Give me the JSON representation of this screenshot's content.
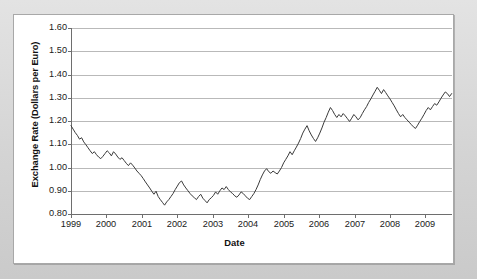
{
  "figure": {
    "background_color": "#d6d6d6",
    "card_color": "#ffffff",
    "line_color": "#3a3a3a",
    "grid_color": "#b9b9b9",
    "axis_color": "#6e6e6e"
  },
  "chart_data": {
    "type": "line",
    "title": "",
    "xlabel": "Date",
    "ylabel": "Exchange Rate (Dollars per Euro)",
    "ylim": [
      0.8,
      1.6
    ],
    "xlim": [
      1999.0,
      2009.75
    ],
    "grid": true,
    "legend": "none",
    "ytick_labels": [
      "0.80",
      "0.90",
      "1.00",
      "1.10",
      "1.20",
      "1.30",
      "1.40",
      "1.50",
      "1.60"
    ],
    "ytick_values": [
      0.8,
      0.9,
      1.0,
      1.1,
      1.2,
      1.3,
      1.4,
      1.5,
      1.6
    ],
    "xtick_labels": [
      "1999",
      "2000",
      "2001",
      "2002",
      "2003",
      "2004",
      "2005",
      "2006",
      "2007",
      "2008",
      "2009"
    ],
    "xtick_values": [
      1999,
      2000,
      2001,
      2002,
      2003,
      2004,
      2005,
      2006,
      2007,
      2008,
      2009
    ],
    "series": [
      {
        "name": "USD per EUR",
        "x": [
          1999.0,
          1999.06,
          1999.12,
          1999.18,
          1999.24,
          1999.3,
          1999.36,
          1999.42,
          1999.48,
          1999.54,
          1999.6,
          1999.66,
          1999.72,
          1999.78,
          1999.84,
          1999.9,
          1999.96,
          2000.02,
          2000.08,
          2000.14,
          2000.2,
          2000.26,
          2000.32,
          2000.38,
          2000.44,
          2000.5,
          2000.56,
          2000.62,
          2000.68,
          2000.74,
          2000.8,
          2000.86,
          2000.92,
          2000.98,
          2001.04,
          2001.1,
          2001.16,
          2001.22,
          2001.28,
          2001.34,
          2001.4,
          2001.46,
          2001.52,
          2001.58,
          2001.64,
          2001.7,
          2001.76,
          2001.82,
          2001.88,
          2001.94,
          2002.0,
          2002.06,
          2002.12,
          2002.18,
          2002.24,
          2002.3,
          2002.36,
          2002.42,
          2002.48,
          2002.54,
          2002.6,
          2002.66,
          2002.72,
          2002.78,
          2002.84,
          2002.9,
          2002.96,
          2003.02,
          2003.08,
          2003.14,
          2003.2,
          2003.26,
          2003.32,
          2003.38,
          2003.44,
          2003.5,
          2003.56,
          2003.62,
          2003.68,
          2003.74,
          2003.8,
          2003.86,
          2003.92,
          2003.98,
          2004.04,
          2004.1,
          2004.16,
          2004.22,
          2004.28,
          2004.34,
          2004.4,
          2004.46,
          2004.52,
          2004.58,
          2004.64,
          2004.7,
          2004.76,
          2004.82,
          2004.88,
          2004.94,
          2005.0,
          2005.06,
          2005.12,
          2005.18,
          2005.24,
          2005.3,
          2005.36,
          2005.42,
          2005.48,
          2005.54,
          2005.6,
          2005.66,
          2005.72,
          2005.78,
          2005.84,
          2005.9,
          2005.96,
          2006.02,
          2006.08,
          2006.14,
          2006.2,
          2006.26,
          2006.32,
          2006.38,
          2006.44,
          2006.5,
          2006.56,
          2006.62,
          2006.68,
          2006.74,
          2006.8,
          2006.86,
          2006.92,
          2006.98,
          2007.04,
          2007.1,
          2007.16,
          2007.22,
          2007.28,
          2007.34,
          2007.4,
          2007.46,
          2007.52,
          2007.58,
          2007.64,
          2007.7,
          2007.76,
          2007.82,
          2007.88,
          2007.94,
          2008.0,
          2008.06,
          2008.12,
          2008.18,
          2008.24,
          2008.3,
          2008.36,
          2008.42,
          2008.48,
          2008.54,
          2008.6,
          2008.66,
          2008.72,
          2008.78,
          2008.84,
          2008.9,
          2008.96,
          2009.02,
          2009.08,
          2009.14,
          2009.2,
          2009.26,
          2009.32,
          2009.38,
          2009.44,
          2009.5,
          2009.56,
          2009.62,
          2009.68,
          2009.74
        ],
        "y": [
          1.18,
          1.165,
          1.15,
          1.138,
          1.122,
          1.128,
          1.11,
          1.098,
          1.085,
          1.072,
          1.06,
          1.068,
          1.055,
          1.045,
          1.038,
          1.048,
          1.06,
          1.072,
          1.063,
          1.05,
          1.068,
          1.058,
          1.045,
          1.035,
          1.042,
          1.03,
          1.018,
          1.008,
          1.02,
          1.01,
          0.998,
          0.985,
          0.975,
          0.965,
          0.952,
          0.938,
          0.925,
          0.912,
          0.898,
          0.885,
          0.898,
          0.875,
          0.862,
          0.85,
          0.838,
          0.852,
          0.862,
          0.875,
          0.888,
          0.905,
          0.92,
          0.935,
          0.942,
          0.925,
          0.912,
          0.9,
          0.888,
          0.878,
          0.87,
          0.862,
          0.875,
          0.885,
          0.868,
          0.858,
          0.848,
          0.862,
          0.87,
          0.88,
          0.895,
          0.885,
          0.9,
          0.912,
          0.905,
          0.918,
          0.905,
          0.895,
          0.888,
          0.878,
          0.872,
          0.882,
          0.895,
          0.888,
          0.878,
          0.868,
          0.862,
          0.875,
          0.888,
          0.905,
          0.925,
          0.948,
          0.968,
          0.985,
          0.995,
          0.982,
          0.975,
          0.985,
          0.978,
          0.972,
          0.985,
          1.0,
          1.02,
          1.035,
          1.05,
          1.068,
          1.055,
          1.072,
          1.088,
          1.105,
          1.125,
          1.148,
          1.165,
          1.18,
          1.158,
          1.14,
          1.125,
          1.112,
          1.128,
          1.148,
          1.17,
          1.195,
          1.215,
          1.238,
          1.258,
          1.245,
          1.228,
          1.215,
          1.228,
          1.218,
          1.232,
          1.222,
          1.21,
          1.198,
          1.212,
          1.228,
          1.218,
          1.205,
          1.215,
          1.232,
          1.248,
          1.262,
          1.28,
          1.295,
          1.312,
          1.328,
          1.345,
          1.332,
          1.318,
          1.335,
          1.322,
          1.308,
          1.295,
          1.28,
          1.265,
          1.248,
          1.232,
          1.218,
          1.228,
          1.215,
          1.205,
          1.195,
          1.185,
          1.175,
          1.168,
          1.182,
          1.198,
          1.212,
          1.228,
          1.245,
          1.258,
          1.248,
          1.262,
          1.275,
          1.268,
          1.282,
          1.298,
          1.312,
          1.325,
          1.318,
          1.305,
          1.318
        ]
      }
    ],
    "annotations": {
      "start_value": 1.18,
      "trough_year": 2001,
      "trough_value": 0.83,
      "mid_peak_year": 2005,
      "mid_peak_value": 1.35,
      "max_year": 2008,
      "max_value": 1.59,
      "end_value": 1.4
    }
  }
}
